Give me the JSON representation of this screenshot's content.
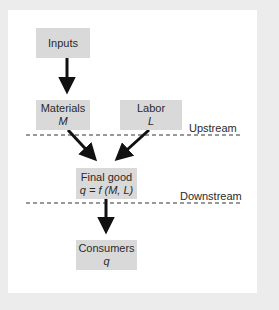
{
  "diagram": {
    "nodes": {
      "inputs": {
        "title": "Inputs"
      },
      "materials": {
        "title": "Materials",
        "symbol": "M"
      },
      "labor": {
        "title": "Labor",
        "symbol": "L"
      },
      "final_good": {
        "title": "Final good",
        "formula": "q = f (M, L)"
      },
      "consumers": {
        "title": "Consumers",
        "symbol": "q"
      }
    },
    "dividers": {
      "upstream": "Upstream",
      "downstream": "Downstream"
    },
    "edges": [
      {
        "from": "inputs",
        "to": "materials"
      },
      {
        "from": "materials",
        "to": "final_good"
      },
      {
        "from": "labor",
        "to": "final_good"
      },
      {
        "from": "final_good",
        "to": "consumers"
      }
    ],
    "colors": {
      "box_fill": "#d9d9d9",
      "background": "#ececec",
      "panel": "#ffffff",
      "arrow": "#111111"
    }
  }
}
